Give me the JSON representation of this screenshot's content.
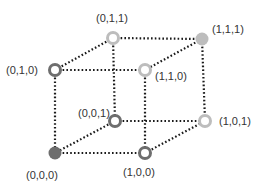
{
  "diagram": {
    "type": "cube-lattice",
    "colors": {
      "dark": "#6e6e6e",
      "light": "#bdbdbd",
      "edge": "#1a1a1a",
      "background": "#ffffff",
      "text": "#333333"
    },
    "vertices": [
      {
        "id": "v010",
        "label": "(0,1,0)",
        "x": 55,
        "y": 70,
        "style": "ring",
        "shade": "dark",
        "lx": 6,
        "ly": 74
      },
      {
        "id": "v011",
        "label": "(0,1,1)",
        "x": 113,
        "y": 38,
        "style": "ring",
        "shade": "light",
        "lx": 96,
        "ly": 22
      },
      {
        "id": "v111",
        "label": "(1,1,1)",
        "x": 202,
        "y": 39,
        "style": "filled",
        "shade": "light",
        "lx": 212,
        "ly": 33
      },
      {
        "id": "v110",
        "label": "(1,1,0)",
        "x": 145,
        "y": 70,
        "style": "ring",
        "shade": "light",
        "lx": 155,
        "ly": 80
      },
      {
        "id": "v001",
        "label": "(0,0,1)",
        "x": 115,
        "y": 121,
        "style": "ring",
        "shade": "dark",
        "lx": 78,
        "ly": 117
      },
      {
        "id": "v101",
        "label": "(1,0,1)",
        "x": 205,
        "y": 121,
        "style": "ring",
        "shade": "light",
        "lx": 219,
        "ly": 125
      },
      {
        "id": "v000",
        "label": "(0,0,0)",
        "x": 55,
        "y": 153,
        "style": "filled",
        "shade": "dark",
        "lx": 26,
        "ly": 179
      },
      {
        "id": "v100",
        "label": "(1,0,0)",
        "x": 145,
        "y": 153,
        "style": "ring",
        "shade": "dark",
        "lx": 123,
        "ly": 176
      }
    ],
    "edges": [
      [
        "v010",
        "v110"
      ],
      [
        "v010",
        "v011"
      ],
      [
        "v010",
        "v000"
      ],
      [
        "v011",
        "v111"
      ],
      [
        "v011",
        "v001"
      ],
      [
        "v111",
        "v110"
      ],
      [
        "v111",
        "v101"
      ],
      [
        "v110",
        "v100"
      ],
      [
        "v001",
        "v101"
      ],
      [
        "v001",
        "v000"
      ],
      [
        "v000",
        "v100"
      ],
      [
        "v100",
        "v101"
      ]
    ]
  }
}
